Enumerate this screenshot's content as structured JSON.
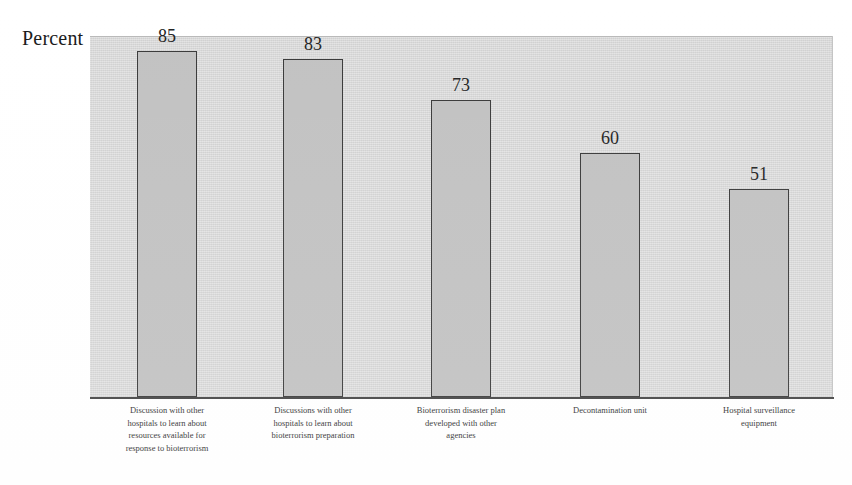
{
  "chart_data": {
    "type": "bar",
    "title": "",
    "subtitle": "",
    "xlabel": "",
    "ylabel": "Percent",
    "ylim": [
      0,
      100
    ],
    "grid": false,
    "legend": false,
    "legend_position": "none",
    "orientation": "vertical",
    "value_labels_shown": true,
    "axis_tick_values_shown": false,
    "categories": [
      "Discussion with other hospitals to learn about resources available for response to bioterrorism",
      "Discussions with other hospitals to learn about bioterrorism preparation",
      "Bioterrorism disaster plan developed with other agencies",
      "Decontamination unit",
      "Hospital surveillance equipment"
    ],
    "category_lines": [
      [
        "Discussion with other",
        "hospitals to learn about",
        "resources available for",
        "response to bioterrorism"
      ],
      [
        "Discussions with other",
        "hospitals to learn about",
        "bioterrorism preparation"
      ],
      [
        "Bioterrorism disaster plan",
        "developed with other",
        "agencies"
      ],
      [
        "Decontamination unit"
      ],
      [
        "Hospital surveillance",
        "equipment"
      ]
    ],
    "values": [
      85,
      83,
      73,
      60,
      51
    ],
    "value_labels": [
      "85",
      "83",
      "73",
      "60",
      "51"
    ]
  },
  "style": {
    "plot_background": "#d6d6d6",
    "bar_fill": "#c2c2c2",
    "bar_border": "#3a3a3a",
    "axis_color": "#444444",
    "text_color": "#242424",
    "page_background": "#ffffff"
  },
  "geometry": {
    "plot_left": 90,
    "plot_top": 36,
    "plot_width": 743,
    "plot_height": 362,
    "baseline_y": 397,
    "bar_width": 60,
    "px_per_unit": 4.07,
    "bar_left_positions": [
      137,
      283,
      431,
      580,
      729
    ],
    "value_label_centers": [
      167,
      313,
      461,
      610,
      759
    ]
  }
}
